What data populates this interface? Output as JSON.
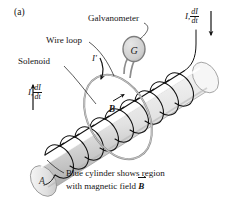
{
  "figure": {
    "panel_label": "(a)",
    "labels": {
      "galvanometer": "Galvanometer",
      "galvanometer_symbol": "G",
      "wire_loop": "Wire loop",
      "solenoid": "Solenoid",
      "induced_current": "I′",
      "cylinder_end": "A",
      "field_symbol": "B",
      "current_symbol": "I,",
      "derivative_numerator": "dI",
      "derivative_denominator": "dt",
      "caption_line1": "Blue cylinder shows region",
      "caption_line2_prefix": "with magnetic field ",
      "caption_line2_vector": "B"
    },
    "colors": {
      "ink": "#141414",
      "cylinder_light": "#f2f2f2",
      "cylinder_mid": "#d9d9d9",
      "cylinder_shadow": "#a8a8a8",
      "coil_stroke": "#111111",
      "loop_stroke": "#8a8a8a",
      "galv_fill": "#d0d0d0",
      "background": "#ffffff"
    },
    "arrows": {
      "left_current_direction": "up",
      "right_current_direction": "down",
      "induced_current_direction": "curved-down"
    }
  }
}
